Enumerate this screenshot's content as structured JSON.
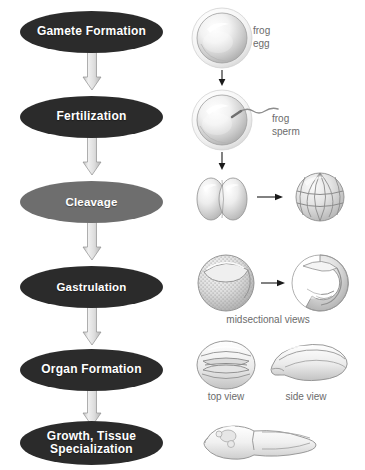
{
  "diagram": {
    "background_color": "#ffffff",
    "node_dark_color": "#2b2b2b",
    "node_mid_color": "#6e6e6e",
    "node_text_color": "#ffffff",
    "arrow_fill_color": "#d9d9d9",
    "arrow_stroke_color": "#8a8a8a",
    "caption_color": "#6b6b6b",
    "small_arrow_color": "#1a1a1a"
  },
  "stages": [
    {
      "id": "gamete-formation",
      "label": "Gamete Formation",
      "style": "dark"
    },
    {
      "id": "fertilization",
      "label": "Fertilization",
      "style": "dark"
    },
    {
      "id": "cleavage",
      "label": "Cleavage",
      "style": "mid"
    },
    {
      "id": "gastrulation",
      "label": "Gastrulation",
      "style": "dark"
    },
    {
      "id": "organ-formation",
      "label": "Organ Formation",
      "style": "dark"
    },
    {
      "id": "growth-tissue",
      "label": "Growth, Tissue\nSpecialization",
      "style": "dark"
    }
  ],
  "labels": {
    "frog_egg": "frog\negg",
    "frog_sperm": "frog\nsperm",
    "midsectional_views": "midsectional views",
    "top_view": "top view",
    "side_view": "side view"
  },
  "illustrations": [
    {
      "id": "frog-egg",
      "name": "frog egg"
    },
    {
      "id": "fertilized-egg",
      "name": "fertilized egg with sperm"
    },
    {
      "id": "two-cell-stage",
      "name": "two-cell stage"
    },
    {
      "id": "morula",
      "name": "multicellular cleavage stage"
    },
    {
      "id": "blastula-midsection",
      "name": "blastula midsectional view"
    },
    {
      "id": "gastrula-midsection",
      "name": "gastrula midsectional view"
    },
    {
      "id": "neurula-top",
      "name": "neurula top view"
    },
    {
      "id": "neurula-side",
      "name": "neurula side view"
    },
    {
      "id": "tadpole",
      "name": "tadpole"
    }
  ]
}
